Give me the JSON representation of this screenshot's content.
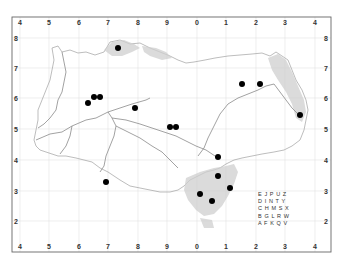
{
  "map": {
    "frame": {
      "left": 12,
      "top": 17,
      "right": 331,
      "bottom": 252
    },
    "grid": {
      "columns": [
        {
          "label": "4",
          "x": 20
        },
        {
          "label": "5",
          "x": 49
        },
        {
          "label": "6",
          "x": 79
        },
        {
          "label": "7",
          "x": 108
        },
        {
          "label": "8",
          "x": 138
        },
        {
          "label": "9",
          "x": 167
        },
        {
          "label": "0",
          "x": 197
        },
        {
          "label": "1",
          "x": 226
        },
        {
          "label": "2",
          "x": 256
        },
        {
          "label": "3",
          "x": 285
        },
        {
          "label": "4",
          "x": 315
        }
      ],
      "rows": [
        {
          "label": "8",
          "y": 38
        },
        {
          "label": "7",
          "y": 68
        },
        {
          "label": "6",
          "y": 98
        },
        {
          "label": "5",
          "y": 129
        },
        {
          "label": "4",
          "y": 160
        },
        {
          "label": "3",
          "y": 191
        },
        {
          "label": "2",
          "y": 221
        }
      ],
      "line_color": "#e2e2e2"
    },
    "colors": {
      "frame": "#666666",
      "coast": "#9a9a9a",
      "river": "#888888",
      "shaded": "#c8c8c8",
      "dot": "#000000"
    },
    "dots": [
      {
        "x": 118,
        "y": 48
      },
      {
        "x": 88,
        "y": 103
      },
      {
        "x": 94,
        "y": 97
      },
      {
        "x": 100,
        "y": 97
      },
      {
        "x": 135,
        "y": 108
      },
      {
        "x": 170,
        "y": 127
      },
      {
        "x": 176,
        "y": 127
      },
      {
        "x": 242,
        "y": 84
      },
      {
        "x": 260,
        "y": 84
      },
      {
        "x": 300,
        "y": 115
      },
      {
        "x": 218,
        "y": 157
      },
      {
        "x": 218,
        "y": 176
      },
      {
        "x": 230,
        "y": 188
      },
      {
        "x": 200,
        "y": 194
      },
      {
        "x": 212,
        "y": 201
      },
      {
        "x": 106,
        "y": 182
      }
    ],
    "key_grid": {
      "x": 258,
      "y": 196,
      "rows": [
        "E J P U Z",
        "D I N T Y",
        "C H M S X",
        "B G L R W",
        "A F K Q V"
      ]
    }
  }
}
